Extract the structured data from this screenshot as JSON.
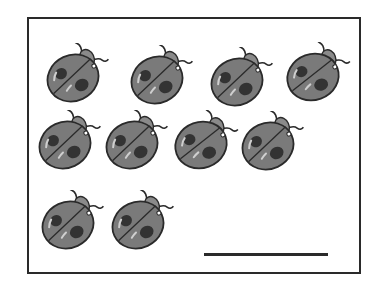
{
  "worksheet": {
    "task": "count the ladybugs",
    "ladybug_count": 10,
    "rows": [
      {
        "count": 4,
        "bugs": [
          {
            "x": 73,
            "y": 78,
            "rot": -25
          },
          {
            "x": 157,
            "y": 80,
            "rot": -25
          },
          {
            "x": 237,
            "y": 82,
            "rot": -25
          },
          {
            "x": 313,
            "y": 77,
            "rot": -20
          }
        ]
      },
      {
        "count": 4,
        "bugs": [
          {
            "x": 65,
            "y": 145,
            "rot": -25
          },
          {
            "x": 132,
            "y": 145,
            "rot": -25
          },
          {
            "x": 201,
            "y": 145,
            "rot": -20
          },
          {
            "x": 268,
            "y": 146,
            "rot": -25
          }
        ]
      },
      {
        "count": 2,
        "bugs": [
          {
            "x": 68,
            "y": 225,
            "rot": -25
          },
          {
            "x": 138,
            "y": 225,
            "rot": -25
          }
        ]
      }
    ],
    "answer_value": ""
  },
  "colors": {
    "body": "#7a7a7a",
    "outline": "#2a2a2a",
    "spot": "#333333",
    "highlight": "#cfcfcf",
    "border": "#2a2a2a"
  }
}
